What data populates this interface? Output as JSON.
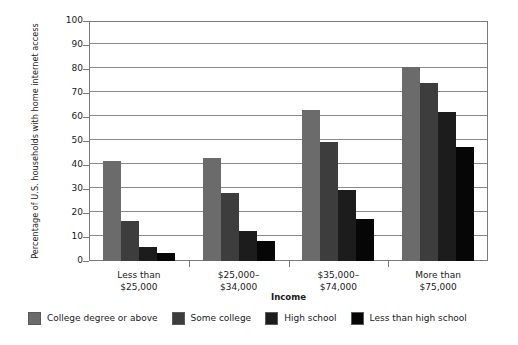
{
  "chart_data": {
    "type": "bar",
    "title": "",
    "subtitle": "",
    "xlabel": "Income",
    "ylabel": "Percentage of U.S. households with home internet access",
    "ylim": [
      0,
      100
    ],
    "ytick_step": 10,
    "yticks": [
      "100",
      "90",
      "80",
      "70",
      "60",
      "50",
      "40",
      "30",
      "20",
      "10",
      "0"
    ],
    "grid": true,
    "legend_position": "bottom",
    "categories": [
      [
        "Less than",
        "$25,000"
      ],
      [
        "$25,000–",
        "$34,000"
      ],
      [
        "$35,000–",
        "$74,000"
      ],
      [
        "More than",
        "$75,000"
      ]
    ],
    "series": [
      {
        "name": "College degree or above",
        "color": "#6b6b6b",
        "values": [
          41.5,
          43,
          63,
          81
        ]
      },
      {
        "name": "Some college",
        "color": "#3d3d3d",
        "values": [
          16.5,
          28.5,
          49.5,
          74
        ]
      },
      {
        "name": "High school",
        "color": "#1c1c1c",
        "values": [
          6,
          12.5,
          29.5,
          62
        ]
      },
      {
        "name": "Less than high school",
        "color": "#060606",
        "values": [
          3.5,
          8.5,
          17.5,
          47.5
        ]
      }
    ]
  }
}
